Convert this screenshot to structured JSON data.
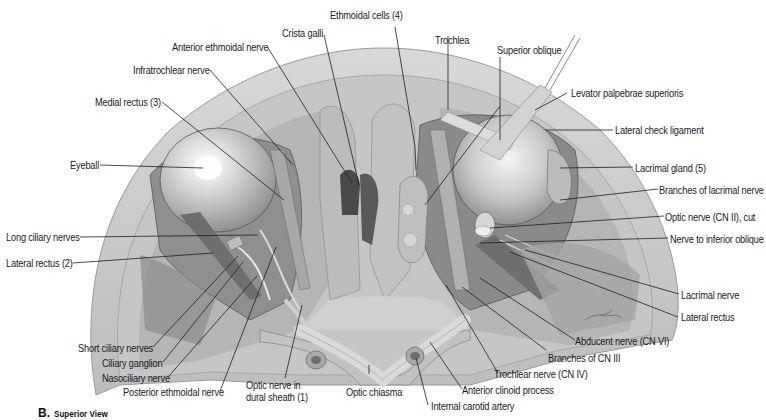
{
  "figure": {
    "panel_letter": "B.",
    "caption": "Superior View",
    "labels": {
      "ethmoidal_cells": "Ethmoidal cells (4)",
      "crista_galli": "Crista galli",
      "anterior_ethmoidal_nerve": "Anterior ethmoidal nerve",
      "infratrochlear_nerve": "Infratrochlear nerve",
      "medial_rectus": "Medial rectus (3)",
      "eyeball": "Eyeball",
      "long_ciliary_nerves": "Long ciliary nerves",
      "lateral_rectus_left": "Lateral rectus (2)",
      "short_ciliary_nerves": "Short ciliary nerves",
      "ciliary_ganglion": "Ciliary ganglion",
      "nasociliary_nerve": "Nasociliary nerve",
      "posterior_ethmoidal_nerve": "Posterior ethmoidal nerve",
      "optic_nerve_dural_line1": "Optic nerve in",
      "optic_nerve_dural_line2": "dural sheath (1)",
      "optic_chiasma": "Optic chiasma",
      "internal_carotid_artery": "Internal carotid artery",
      "anterior_clinoid_process": "Anterior clinoid process",
      "trochlear_nerve": "Trochlear nerve (CN IV)",
      "branches_cn3": "Branches of CN III",
      "abducent_nerve": "Abducent nerve (CN VI)",
      "lateral_rectus_right": "Lateral rectus",
      "lacrimal_nerve": "Lacrimal nerve",
      "nerve_inferior_oblique": "Nerve to inferior oblique",
      "optic_nerve_cut": "Optic nerve (CN II), cut",
      "branches_lacrimal_nerve": "Branches of lacrimal nerve",
      "lacrimal_gland": "Lacrimal gland (5)",
      "lateral_check_ligament": "Lateral check ligament",
      "levator_palpebrae": "Levator palpebrae superioris",
      "superior_oblique": "Superior oblique",
      "trochlea": "Trochlea"
    }
  }
}
